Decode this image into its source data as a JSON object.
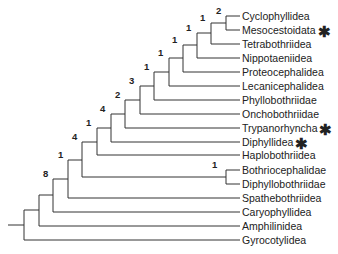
{
  "diagram": {
    "type": "phylogenetic-tree",
    "taxa": [
      {
        "name": "Cyclophyllidea",
        "marked": false
      },
      {
        "name": "Mesocestoidata",
        "marked": true
      },
      {
        "name": "Tetrabothriidea",
        "marked": false
      },
      {
        "name": "Nippotaeniidea",
        "marked": false
      },
      {
        "name": "Proteocephalidea",
        "marked": false
      },
      {
        "name": "Lecanicephalidea",
        "marked": false
      },
      {
        "name": "Phyllobothriidae",
        "marked": false
      },
      {
        "name": "Onchobothriidae",
        "marked": false
      },
      {
        "name": "Trypanorhyncha",
        "marked": true
      },
      {
        "name": "Diphyllidea",
        "marked": true
      },
      {
        "name": "Haplobothriidea",
        "marked": false
      },
      {
        "name": "Bothriocephalidae",
        "marked": false
      },
      {
        "name": "Diphyllobothriidae",
        "marked": false
      },
      {
        "name": "Spathebothriidea",
        "marked": false
      },
      {
        "name": "Caryophyllidea",
        "marked": false
      },
      {
        "name": "Amphilinidea",
        "marked": false
      },
      {
        "name": "Gyrocotylidea",
        "marked": false
      }
    ],
    "marker_symbol": "✱",
    "support_values": [
      {
        "id": "n_cyc_mes",
        "value": "2"
      },
      {
        "id": "n_tetra",
        "value": "1"
      },
      {
        "id": "n_nippo",
        "value": "1"
      },
      {
        "id": "n_proteo",
        "value": "1"
      },
      {
        "id": "n_lecani",
        "value": "1"
      },
      {
        "id": "n_phyllo",
        "value": "1"
      },
      {
        "id": "n_oncho",
        "value": "3"
      },
      {
        "id": "n_trypano",
        "value": "2"
      },
      {
        "id": "n_diphyllidea",
        "value": "4"
      },
      {
        "id": "n_haplo",
        "value": "1"
      },
      {
        "id": "n_bothrio_diphyllo",
        "value": "1"
      },
      {
        "id": "n_eucestoda_core",
        "value": "4"
      },
      {
        "id": "n_spathe",
        "value": "1"
      },
      {
        "id": "n_caryo",
        "value": "8"
      }
    ]
  }
}
